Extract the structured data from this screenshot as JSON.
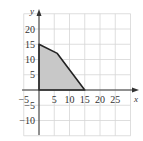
{
  "chart_data": {
    "type": "area",
    "title": "",
    "xlabel": "x",
    "ylabel": "y",
    "xlim": [
      -5,
      30
    ],
    "ylim": [
      -15,
      25
    ],
    "grid": true,
    "grid_step": 5,
    "x_ticks": [
      "−5",
      "5",
      "10",
      "15",
      "20",
      "25"
    ],
    "y_ticks": [
      "20",
      "15",
      "10",
      "5",
      "−5",
      "−10"
    ],
    "polygon": {
      "name": "feasible region",
      "vertices": [
        [
          0,
          0
        ],
        [
          0,
          15
        ],
        [
          6,
          12
        ],
        [
          15,
          0
        ]
      ],
      "fill": "#c8c8c8",
      "stroke": "#222222"
    }
  },
  "colors": {
    "grid": "#d6d6d6",
    "axis": "#333333",
    "region_fill": "#c8c8c8",
    "region_stroke": "#222222"
  }
}
